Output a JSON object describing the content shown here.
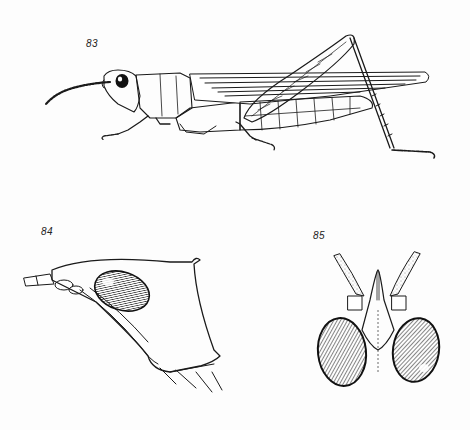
{
  "plate": {
    "background": "#fdfdfd",
    "ink_color": "#1a1a1a",
    "figures": [
      {
        "number": "83",
        "subject": "grasshopper-lateral-view"
      },
      {
        "number": "84",
        "subject": "head-lateral-view"
      },
      {
        "number": "85",
        "subject": "head-dorsal-view"
      }
    ]
  }
}
